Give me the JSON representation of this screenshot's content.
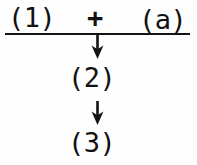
{
  "figure": {
    "kind": "reaction-scheme",
    "orientation": "vertical",
    "background_color": "#fefefe",
    "ink_color": "#141414"
  },
  "scheme": {
    "reactant_left": "(1)",
    "operator": "+",
    "reagent_right": "(a)",
    "intermediate": "(2)",
    "product": "(3)",
    "arrow_down_1": "down-arrow",
    "arrow_down_2": "down-arrow",
    "reaction_rule": "horizontal-reaction-line"
  }
}
